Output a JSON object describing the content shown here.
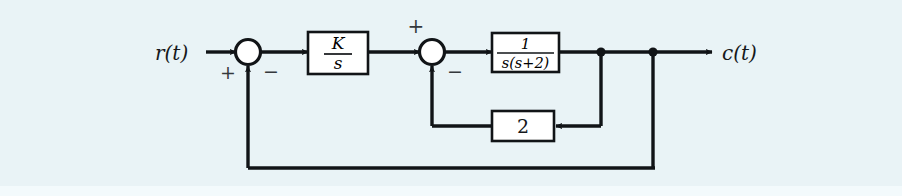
{
  "figure": {
    "kind": "control-system-block-diagram",
    "background_color": "#e9f3f6",
    "line_color": "#111417",
    "block_fill": "#ffffff",
    "block_stroke": "#111417"
  },
  "signals": {
    "input_label": "r(t)",
    "output_label": "c(t)"
  },
  "summing_junctions": [
    {
      "id": "sum-1",
      "input_sign": "+",
      "feedback_sign": "−",
      "cx": 248,
      "cy": 52,
      "r": 12
    },
    {
      "id": "sum-2",
      "input_sign": "+",
      "feedback_sign": "−",
      "cx": 432,
      "cy": 52,
      "r": 12
    }
  ],
  "blocks": [
    {
      "id": "controller",
      "type": "fraction",
      "numerator": "K",
      "denominator": "s",
      "x": 308,
      "y": 32,
      "w": 60,
      "h": 42
    },
    {
      "id": "plant",
      "type": "fraction",
      "numerator": "1",
      "denominator": "s(s+2)",
      "x": 492,
      "y": 33,
      "w": 67,
      "h": 39
    },
    {
      "id": "inner-feedback-gain",
      "type": "gain",
      "value": "2",
      "x": 492,
      "y": 111,
      "w": 62,
      "h": 30
    }
  ],
  "nodes": [
    {
      "id": "inner-loop-tap",
      "x": 601,
      "y": 52
    },
    {
      "id": "outer-loop-tap",
      "x": 653,
      "y": 52
    }
  ],
  "paths": {
    "input_line": "r(t) → sum-1",
    "forward_1": "sum-1 → K/s",
    "forward_2": "K/s → sum-2",
    "forward_3": "sum-2 → 1/(s(s+2))",
    "output_line": "1/(s(s+2)) → c(t)",
    "inner_feedback": "inner-loop-tap → down → gain 2 → left → up → sum-2",
    "outer_feedback": "outer-loop-tap → down → left → up → sum-1"
  }
}
